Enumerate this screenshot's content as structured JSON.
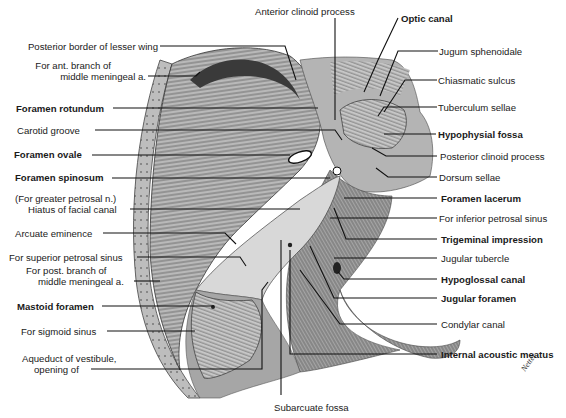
{
  "figure": {
    "colors": {
      "background": "#ffffff",
      "bone_gray": "#a8a8a8",
      "bone_light": "#d4d4d4",
      "bone_dark": "#6e6e6e",
      "line": "#111111"
    }
  },
  "labels": {
    "top": [
      {
        "id": "anterior-clinoid-process",
        "text": "Anterior clinoid process",
        "bold": false
      }
    ],
    "left": [
      {
        "id": "posterior-border-lesser-wing",
        "text": "Posterior border of lesser wing",
        "bold": false
      },
      {
        "id": "ant-branch-mma-1",
        "text": "For ant. branch of",
        "bold": false
      },
      {
        "id": "ant-branch-mma-2",
        "text": "middle meningeal a.",
        "bold": false
      },
      {
        "id": "foramen-rotundum",
        "text": "Foramen rotundum",
        "bold": true
      },
      {
        "id": "carotid-groove",
        "text": "Carotid groove",
        "bold": false
      },
      {
        "id": "foramen-ovale",
        "text": "Foramen ovale",
        "bold": true
      },
      {
        "id": "foramen-spinosum",
        "text": "Foramen spinosum",
        "bold": true
      },
      {
        "id": "hiatus-facial-canal-1",
        "text": "(For greater petrosal n.)",
        "bold": false
      },
      {
        "id": "hiatus-facial-canal-2",
        "text": "Hiatus of facial canal",
        "bold": false
      },
      {
        "id": "arcuate-eminence",
        "text": "Arcuate eminence",
        "bold": false
      },
      {
        "id": "superior-petrosal-sinus",
        "text": "For superior petrosal sinus",
        "bold": false
      },
      {
        "id": "post-branch-mma-1",
        "text": "For post. branch of",
        "bold": false
      },
      {
        "id": "post-branch-mma-2",
        "text": "middle meningeal a.",
        "bold": false
      },
      {
        "id": "mastoid-foramen",
        "text": "Mastoid foramen",
        "bold": true
      },
      {
        "id": "sigmoid-sinus",
        "text": "For sigmoid sinus",
        "bold": false
      },
      {
        "id": "aqueduct-vestibule-1",
        "text": "Aqueduct of vestibule,",
        "bold": false
      },
      {
        "id": "aqueduct-vestibule-2",
        "text": "opening of",
        "bold": false
      }
    ],
    "right": [
      {
        "id": "optic-canal",
        "text": "Optic canal",
        "bold": true
      },
      {
        "id": "jugum-sphenoidale",
        "text": "Jugum sphenoidale",
        "bold": false
      },
      {
        "id": "chiasmatic-sulcus",
        "text": "Chiasmatic sulcus",
        "bold": false
      },
      {
        "id": "tuberculum-sellae",
        "text": "Tuberculum sellae",
        "bold": false
      },
      {
        "id": "hypophysial-fossa",
        "text": "Hypophysial fossa",
        "bold": true
      },
      {
        "id": "posterior-clinoid-process",
        "text": "Posterior clinoid process",
        "bold": false
      },
      {
        "id": "dorsum-sellae",
        "text": "Dorsum sellae",
        "bold": false
      },
      {
        "id": "foramen-lacerum",
        "text": "Foramen lacerum",
        "bold": true
      },
      {
        "id": "inferior-petrosal-sinus",
        "text": "For inferior petrosal sinus",
        "bold": false
      },
      {
        "id": "trigeminal-impression",
        "text": "Trigeminal impression",
        "bold": true
      },
      {
        "id": "jugular-tubercle",
        "text": "Jugular tubercle",
        "bold": false
      },
      {
        "id": "hypoglossal-canal",
        "text": "Hypoglossal canal",
        "bold": true
      },
      {
        "id": "jugular-foramen",
        "text": "Jugular foramen",
        "bold": true
      },
      {
        "id": "condylar-canal",
        "text": "Condylar canal",
        "bold": false
      },
      {
        "id": "internal-acoustic-meatus",
        "text": "Internal acoustic meatus",
        "bold": true
      }
    ],
    "bottom": [
      {
        "id": "subarcuate-fossa",
        "text": "Subarcuate fossa",
        "bold": false
      }
    ]
  },
  "signature": "Netter"
}
